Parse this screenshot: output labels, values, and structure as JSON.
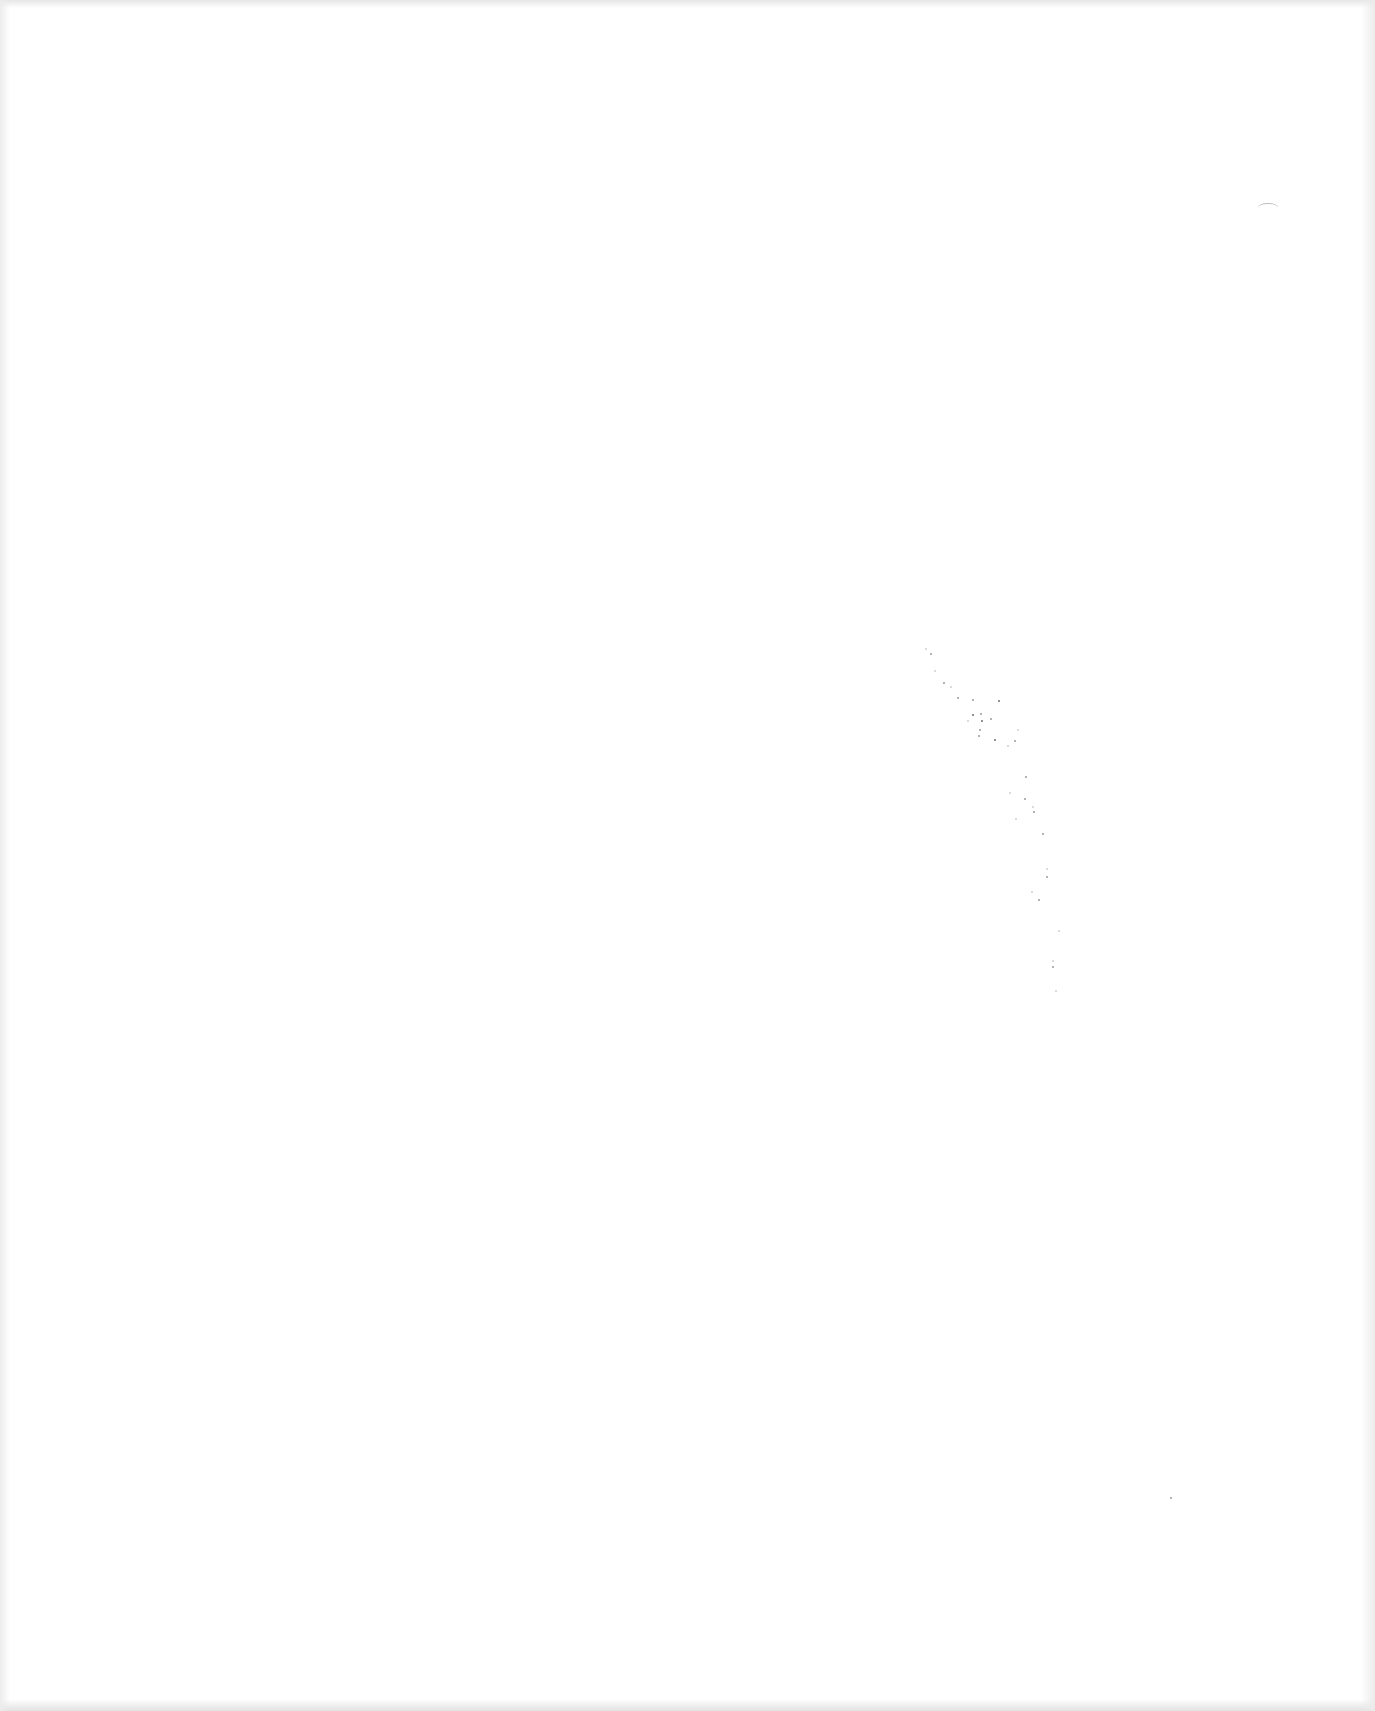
{
  "document": {
    "type": "blank-scanned-page",
    "text": "",
    "background_color": "#ffffff",
    "artifact_color": "#9a9a9a"
  }
}
